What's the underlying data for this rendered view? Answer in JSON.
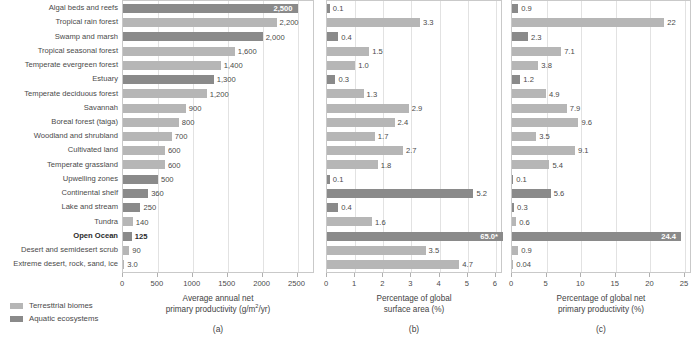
{
  "figure": {
    "legend": [
      {
        "key": "terrestrial",
        "label": "Terresttrial biomes",
        "color": "#b6b6b6"
      },
      {
        "key": "aquatic",
        "label": "Aquatic ecosystems",
        "color": "#8a8a8a"
      }
    ],
    "categories": [
      {
        "label": "Algal beds and reefs",
        "type": "aquatic",
        "highlight": false
      },
      {
        "label": "Tropical rain forest",
        "type": "terrestrial",
        "highlight": false
      },
      {
        "label": "Swamp and marsh",
        "type": "aquatic",
        "highlight": false
      },
      {
        "label": "Tropical seasonal forest",
        "type": "terrestrial",
        "highlight": false
      },
      {
        "label": "Temperate evergreen forest",
        "type": "terrestrial",
        "highlight": false
      },
      {
        "label": "Estuary",
        "type": "aquatic",
        "highlight": false
      },
      {
        "label": "Temperate deciduous forest",
        "type": "terrestrial",
        "highlight": false
      },
      {
        "label": "Savannah",
        "type": "terrestrial",
        "highlight": false
      },
      {
        "label": "Boreal forest (taiga)",
        "type": "terrestrial",
        "highlight": false
      },
      {
        "label": "Woodland and shrubland",
        "type": "terrestrial",
        "highlight": false
      },
      {
        "label": "Cultivated land",
        "type": "terrestrial",
        "highlight": false
      },
      {
        "label": "Temperate grassland",
        "type": "terrestrial",
        "highlight": false
      },
      {
        "label": "Upwelling zones",
        "type": "aquatic",
        "highlight": false
      },
      {
        "label": "Continental shelf",
        "type": "aquatic",
        "highlight": false
      },
      {
        "label": "Lake and stream",
        "type": "aquatic",
        "highlight": false
      },
      {
        "label": "Tundra",
        "type": "terrestrial",
        "highlight": false
      },
      {
        "label": "Open Ocean",
        "type": "aquatic",
        "highlight": true
      },
      {
        "label": "Desert and semidesert scrub",
        "type": "terrestrial",
        "highlight": false
      },
      {
        "label": "Extreme desert, rock, sand, ice",
        "type": "terrestrial",
        "highlight": false
      }
    ]
  },
  "chart_data": [
    {
      "id": "a",
      "type": "bar",
      "orientation": "horizontal",
      "panel_letter": "(a)",
      "title": "",
      "xlabel_line1": "Average annual net",
      "xlabel_line2": "primary productivity (g/m2/yr)",
      "xlabel_units_numerator": "g/m",
      "xlabel_units_sup": "2",
      "xlabel_units_denominator": "/yr",
      "ylabel": "",
      "xlim": [
        0,
        2750
      ],
      "xticks": [
        0,
        500,
        1000,
        1500,
        2000,
        2500
      ],
      "xticklabels": [
        "0",
        "500",
        "1000",
        "1500",
        "2000",
        "2500"
      ],
      "grid": true,
      "legend_position": "below-left",
      "categories": [
        "Algal beds and reefs",
        "Tropical rain forest",
        "Swamp and marsh",
        "Tropical seasonal forest",
        "Temperate evergreen forest",
        "Estuary",
        "Temperate deciduous forest",
        "Savannah",
        "Boreal forest (taiga)",
        "Woodland and shrubland",
        "Cultivated land",
        "Temperate grassland",
        "Upwelling zones",
        "Continental shelf",
        "Lake and stream",
        "Tundra",
        "Open Ocean",
        "Desert and semidesert scrub",
        "Extreme desert, rock, sand, ice"
      ],
      "values": [
        2500,
        2200,
        2000,
        1600,
        1400,
        1300,
        1200,
        900,
        800,
        700,
        600,
        600,
        500,
        360,
        250,
        140,
        125,
        90,
        3.0
      ],
      "value_labels": [
        "2,500",
        "2,200",
        "2,000",
        "1,600",
        "1,400",
        "1,300",
        "1,200",
        "900",
        "800",
        "700",
        "600",
        "600",
        "500",
        "360",
        "250",
        "140",
        "125",
        "90",
        "3.0"
      ],
      "label_inside": [
        true,
        false,
        false,
        false,
        false,
        false,
        false,
        false,
        false,
        false,
        false,
        false,
        false,
        false,
        false,
        false,
        false,
        false,
        false
      ]
    },
    {
      "id": "b",
      "type": "bar",
      "orientation": "horizontal",
      "panel_letter": "(b)",
      "title": "",
      "xlabel_line1": "Percentage of global",
      "xlabel_line2": "surface area (%)",
      "ylabel": "",
      "xlim": [
        0,
        6.25
      ],
      "xticks": [
        0,
        1,
        2,
        3,
        4,
        5,
        6
      ],
      "xticklabels": [
        "0",
        "1",
        "2",
        "3",
        "4",
        "5",
        "6"
      ],
      "grid": true,
      "categories": [
        "Algal beds and reefs",
        "Tropical rain forest",
        "Swamp and marsh",
        "Tropical seasonal forest",
        "Temperate evergreen forest",
        "Estuary",
        "Temperate deciduous forest",
        "Savannah",
        "Boreal forest (taiga)",
        "Woodland and shrubland",
        "Cultivated land",
        "Temperate grassland",
        "Upwelling zones",
        "Continental shelf",
        "Lake and stream",
        "Tundra",
        "Open Ocean",
        "Desert and semidesert scrub",
        "Extreme desert, rock, sand, ice"
      ],
      "values": [
        0.1,
        3.3,
        0.4,
        1.5,
        1.0,
        0.3,
        1.3,
        2.9,
        2.4,
        1.7,
        2.7,
        1.8,
        0.1,
        5.2,
        0.4,
        1.6,
        65.0,
        3.5,
        4.7
      ],
      "value_labels": [
        "0.1",
        "3.3",
        "0.4",
        "1.5",
        "1.0",
        "0.3",
        "1.3",
        "2.9",
        "2.4",
        "1.7",
        "2.7",
        "1.8",
        "0.1",
        "5.2",
        "0.4",
        "1.6",
        "65.0*",
        "3.5",
        "4.7"
      ],
      "clipped": [
        false,
        false,
        false,
        false,
        false,
        false,
        false,
        false,
        false,
        false,
        false,
        false,
        false,
        false,
        false,
        false,
        true,
        false,
        false
      ],
      "label_inside": [
        false,
        false,
        false,
        false,
        false,
        false,
        false,
        false,
        false,
        false,
        false,
        false,
        false,
        false,
        false,
        false,
        true,
        false,
        false
      ]
    },
    {
      "id": "c",
      "type": "bar",
      "orientation": "horizontal",
      "panel_letter": "(c)",
      "title": "",
      "xlabel_line1": "Percentage of global net",
      "xlabel_line2": "primary productivity (%)",
      "ylabel": "",
      "xlim": [
        0,
        26
      ],
      "xticks": [
        0,
        5,
        10,
        15,
        20,
        25
      ],
      "xticklabels": [
        "0",
        "5",
        "10",
        "15",
        "20",
        "25"
      ],
      "grid": true,
      "categories": [
        "Algal beds and reefs",
        "Tropical rain forest",
        "Swamp and marsh",
        "Tropical seasonal forest",
        "Temperate evergreen forest",
        "Estuary",
        "Temperate deciduous forest",
        "Savannah",
        "Boreal forest (taiga)",
        "Woodland and shrubland",
        "Cultivated land",
        "Temperate grassland",
        "Upwelling zones",
        "Continental shelf",
        "Lake and stream",
        "Tundra",
        "Open Ocean",
        "Desert and semidesert scrub",
        "Extreme desert, rock, sand, ice"
      ],
      "values": [
        0.9,
        22,
        2.3,
        7.1,
        3.8,
        1.2,
        4.9,
        7.9,
        9.6,
        3.5,
        9.1,
        5.4,
        0.1,
        5.6,
        0.3,
        0.6,
        24.4,
        0.9,
        0.04
      ],
      "value_labels": [
        "0.9",
        "22",
        "2.3",
        "7.1",
        "3.8",
        "1.2",
        "4.9",
        "7.9",
        "9.6",
        "3.5",
        "9.1",
        "5.4",
        "0.1",
        "5.6",
        "0.3",
        "0.6",
        "24.4",
        "0.9",
        "0.04"
      ],
      "label_inside": [
        false,
        false,
        false,
        false,
        false,
        false,
        false,
        false,
        false,
        false,
        false,
        false,
        false,
        false,
        false,
        false,
        true,
        false,
        false
      ]
    }
  ]
}
